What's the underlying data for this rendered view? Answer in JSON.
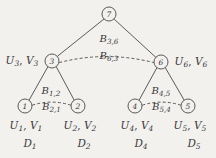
{
  "figure": {
    "type": "tree-diagram",
    "background_color": "#f3f1ee",
    "ink_color": "#39383a"
  },
  "nodes": [
    {
      "id": "7",
      "label": "7",
      "x": 109,
      "y": 14,
      "r": 7
    },
    {
      "id": "3",
      "label": "3",
      "x": 52,
      "y": 61,
      "r": 7
    },
    {
      "id": "6",
      "label": "6",
      "x": 161,
      "y": 62,
      "r": 7
    },
    {
      "id": "1",
      "label": "1",
      "x": 25,
      "y": 106,
      "r": 7
    },
    {
      "id": "2",
      "label": "2",
      "x": 78,
      "y": 106,
      "r": 7
    },
    {
      "id": "4",
      "label": "4",
      "x": 135,
      "y": 106,
      "r": 7
    },
    {
      "id": "5",
      "label": "5",
      "x": 188,
      "y": 106,
      "r": 7
    }
  ],
  "tree_edges": [
    {
      "from": "7",
      "to": "3"
    },
    {
      "from": "7",
      "to": "6"
    },
    {
      "from": "3",
      "to": "1"
    },
    {
      "from": "3",
      "to": "2"
    },
    {
      "from": "6",
      "to": "4"
    },
    {
      "from": "6",
      "to": "5"
    }
  ],
  "message_arcs": [
    {
      "between": [
        "3",
        "6"
      ],
      "upper_label": "B3,6",
      "lower_label": "B6,3"
    },
    {
      "between": [
        "1",
        "2"
      ],
      "upper_label": "B1,2",
      "lower_label": "B2,1"
    },
    {
      "between": [
        "4",
        "5"
      ],
      "upper_label": "B4,5",
      "lower_label": "B5,4"
    }
  ],
  "labels": {
    "b36": {
      "base": "B",
      "sub": "3,6"
    },
    "b63": {
      "base": "B",
      "sub": "6,3"
    },
    "b12": {
      "base": "B",
      "sub": "1,2"
    },
    "b21": {
      "base": "B",
      "sub": "2,1"
    },
    "b45": {
      "base": "B",
      "sub": "4,5"
    },
    "b54": {
      "base": "B",
      "sub": "5,4"
    },
    "uv3": {
      "u": "U",
      "usub": "3",
      "sep": ", ",
      "v": "V",
      "vsub": "3"
    },
    "uv6": {
      "u": "U",
      "usub": "6",
      "sep": ", ",
      "v": "V",
      "vsub": "6"
    },
    "uv1": {
      "u": "U",
      "usub": "1",
      "sep": ", ",
      "v": "V",
      "vsub": "1"
    },
    "uv2": {
      "u": "U",
      "usub": "2",
      "sep": ", ",
      "v": "V",
      "vsub": "2"
    },
    "uv4": {
      "u": "U",
      "usub": "4",
      "sep": ", ",
      "v": "V",
      "vsub": "4"
    },
    "uv5": {
      "u": "U",
      "usub": "5",
      "sep": ", ",
      "v": "V",
      "vsub": "5"
    },
    "d1": {
      "base": "D",
      "sub": "1"
    },
    "d2": {
      "base": "D",
      "sub": "2"
    },
    "d4": {
      "base": "D",
      "sub": "4"
    },
    "d5": {
      "base": "D",
      "sub": "5"
    }
  }
}
